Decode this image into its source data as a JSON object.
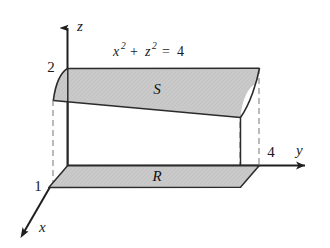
{
  "figure": {
    "equation": {
      "base1": "x",
      "exp1": "2",
      "operator_plus": "+",
      "base2": "z",
      "exp2": "2",
      "equals": "=",
      "value": "4",
      "full": "x² + z² = 4"
    },
    "axes": [
      {
        "name": "z-axis",
        "label": "z",
        "direction": "up"
      },
      {
        "name": "y-axis",
        "label": "y",
        "direction": "right"
      },
      {
        "name": "x-axis",
        "label": "x",
        "direction": "down-left"
      }
    ],
    "ticks": [
      {
        "name": "z-tick-2",
        "label": "2",
        "axis": "z",
        "value": 2
      },
      {
        "name": "x-tick-1",
        "label": "1",
        "axis": "x",
        "value": 1
      },
      {
        "name": "y-tick-4",
        "label": "4",
        "axis": "y",
        "value": 4
      }
    ],
    "regions": [
      {
        "name": "surface-S",
        "label": "S",
        "description": "shaded cylindrical surface band"
      },
      {
        "name": "region-R",
        "label": "R",
        "description": "shaded rectangular region in xy-plane"
      }
    ],
    "colors": {
      "shading": "#c6c6c6",
      "stroke": "#2b2b2b",
      "dashed": "#9a9a9a",
      "background": "#ffffff",
      "text": "#1a1a1a"
    }
  }
}
